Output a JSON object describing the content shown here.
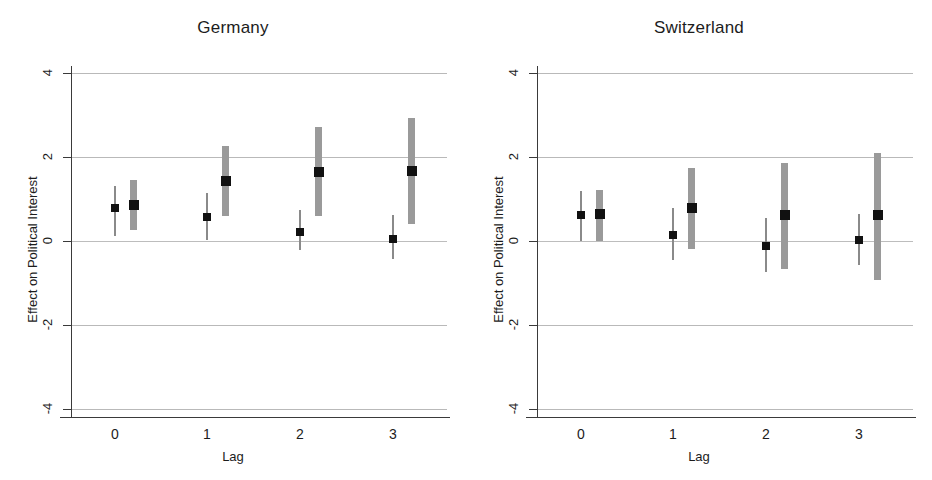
{
  "figure": {
    "x_axis_title": "Lag",
    "y_axis_title": "Effect on Political Interest",
    "y_tick_labels": [
      "4",
      "2",
      "0",
      "-2",
      "-4"
    ],
    "x_tick_labels": [
      "0",
      "1",
      "2",
      "3"
    ],
    "colors": {
      "marker": "#111111",
      "interval_thin": "#8a8a8a",
      "interval_thick": "#9a9a9a",
      "gridline": "#b9b9b9",
      "axis": "#3a3a3a",
      "background": "#ffffff"
    }
  },
  "panels": [
    {
      "title": "Germany"
    },
    {
      "title": "Switzerland"
    }
  ],
  "chart_data": {
    "type": "scatter",
    "xlabel": "Lag",
    "ylabel": "Effect on Political Interest",
    "ylim": [
      -4,
      4
    ],
    "y_ticks": [
      4,
      2,
      0,
      -2,
      -4
    ],
    "x_ticks": [
      0,
      1,
      2,
      3
    ],
    "grid": "horizontal",
    "legend": "none",
    "panels": [
      {
        "name": "Germany",
        "series": [
          {
            "name": "estimate-thin",
            "style": "thin-line",
            "points": [
              {
                "lag": 0,
                "x_offset": 0.0,
                "estimate": 0.79,
                "ci_low": 0.12,
                "ci_high": 1.31
              },
              {
                "lag": 1,
                "x_offset": 0.0,
                "estimate": 0.57,
                "ci_low": 0.02,
                "ci_high": 1.14
              },
              {
                "lag": 2,
                "x_offset": 0.0,
                "estimate": 0.21,
                "ci_low": -0.22,
                "ci_high": 0.74
              },
              {
                "lag": 3,
                "x_offset": 0.0,
                "estimate": 0.05,
                "ci_low": -0.43,
                "ci_high": 0.62
              }
            ]
          },
          {
            "name": "estimate-thick",
            "style": "thick-bar",
            "points": [
              {
                "lag": 0,
                "x_offset": 0.2,
                "estimate": 0.86,
                "ci_low": 0.26,
                "ci_high": 1.45
              },
              {
                "lag": 1,
                "x_offset": 0.2,
                "estimate": 1.43,
                "ci_low": 0.6,
                "ci_high": 2.26
              },
              {
                "lag": 2,
                "x_offset": 0.2,
                "estimate": 1.64,
                "ci_low": 0.6,
                "ci_high": 2.71
              },
              {
                "lag": 3,
                "x_offset": 0.2,
                "estimate": 1.67,
                "ci_low": 0.4,
                "ci_high": 2.93
              }
            ]
          }
        ]
      },
      {
        "name": "Switzerland",
        "series": [
          {
            "name": "estimate-thin",
            "style": "thin-line",
            "points": [
              {
                "lag": 0,
                "x_offset": 0.0,
                "estimate": 0.62,
                "ci_low": 0.0,
                "ci_high": 1.19
              },
              {
                "lag": 1,
                "x_offset": 0.0,
                "estimate": 0.15,
                "ci_low": -0.45,
                "ci_high": 0.79
              },
              {
                "lag": 2,
                "x_offset": 0.0,
                "estimate": -0.12,
                "ci_low": -0.74,
                "ci_high": 0.55
              },
              {
                "lag": 3,
                "x_offset": 0.0,
                "estimate": 0.03,
                "ci_low": -0.57,
                "ci_high": 0.64
              }
            ]
          },
          {
            "name": "estimate-thick",
            "style": "thick-bar",
            "points": [
              {
                "lag": 0,
                "x_offset": 0.2,
                "estimate": 0.64,
                "ci_low": 0.0,
                "ci_high": 1.21
              },
              {
                "lag": 1,
                "x_offset": 0.2,
                "estimate": 0.79,
                "ci_low": -0.19,
                "ci_high": 1.74
              },
              {
                "lag": 2,
                "x_offset": 0.2,
                "estimate": 0.63,
                "ci_low": -0.66,
                "ci_high": 1.86
              },
              {
                "lag": 3,
                "x_offset": 0.2,
                "estimate": 0.63,
                "ci_low": -0.92,
                "ci_high": 2.09
              }
            ]
          }
        ]
      }
    ]
  }
}
